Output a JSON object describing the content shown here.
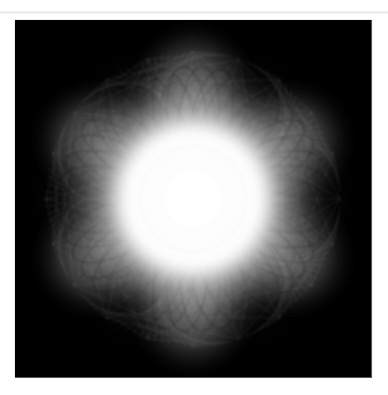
{
  "page": {
    "background_color": "#ffffff",
    "width": 388,
    "height": 395
  },
  "header": {
    "caption": "",
    "rule_color": "#e9e9ec"
  },
  "figure": {
    "title": "",
    "background_color": "#000000",
    "glow_color": "#ffffff",
    "line_color": "#000000",
    "plate": {
      "x": 15,
      "y": 20,
      "width": 357,
      "height": 358
    },
    "center": {
      "x": 178,
      "y": 179
    },
    "star_points": 6,
    "rosette_lines": 120,
    "glow_radius": 172,
    "core_radius": 62
  }
}
